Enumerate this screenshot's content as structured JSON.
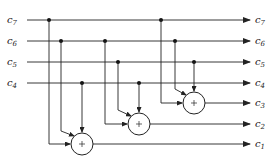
{
  "diagram": {
    "type": "circuit",
    "inputs": [
      {
        "name": "c",
        "sub": "7",
        "y": 20
      },
      {
        "name": "c",
        "sub": "6",
        "y": 41
      },
      {
        "name": "c",
        "sub": "5",
        "y": 62
      },
      {
        "name": "c",
        "sub": "4",
        "y": 83
      }
    ],
    "outputs": [
      {
        "name": "c",
        "sub": "7",
        "y": 20
      },
      {
        "name": "c",
        "sub": "6",
        "y": 41
      },
      {
        "name": "c",
        "sub": "5",
        "y": 62
      },
      {
        "name": "c",
        "sub": "4",
        "y": 83
      },
      {
        "name": "c",
        "sub": "3",
        "y": 103
      },
      {
        "name": "c",
        "sub": "2",
        "y": 124
      },
      {
        "name": "c",
        "sub": "1",
        "y": 145
      }
    ],
    "adders": [
      {
        "output": "c3",
        "symbol": "+",
        "inputs": [
          "c7",
          "c6",
          "c5"
        ]
      },
      {
        "output": "c2",
        "symbol": "+",
        "inputs": [
          "c6",
          "c5",
          "c4"
        ]
      },
      {
        "output": "c1",
        "symbol": "+",
        "inputs": [
          "c7",
          "c6",
          "c4"
        ]
      }
    ],
    "operation": "modulo-2 addition (XOR)"
  }
}
